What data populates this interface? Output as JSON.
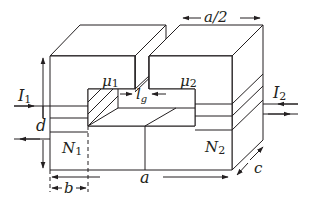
{
  "diagram": {
    "type": "magnetic-core-with-air-gap",
    "labels": {
      "mu1": {
        "main": "μ",
        "sub": "1"
      },
      "mu2": {
        "main": "μ",
        "sub": "2"
      },
      "gap": {
        "main": "l",
        "sub": "g"
      },
      "I1": {
        "main": "I",
        "sub": "1"
      },
      "I2": {
        "main": "I",
        "sub": "2"
      },
      "N1": {
        "main": "N",
        "sub": "1"
      },
      "N2": {
        "main": "N",
        "sub": "2"
      },
      "a": "a",
      "a_half": "a/2",
      "b": "b",
      "c": "c",
      "d": "d"
    },
    "colors": {
      "stroke": "#231f20",
      "background": "#ffffff"
    }
  }
}
